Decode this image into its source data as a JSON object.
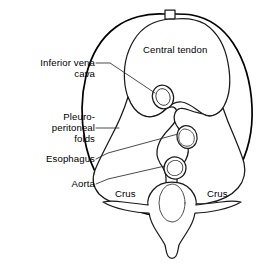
{
  "figure": {
    "line_color": "#000000",
    "background_color": "#ffffff"
  },
  "labels": {
    "inferior_vena_cava": "Inferior vena\ncava",
    "pleuroperitoneal_folds": "Pleuro-\nperitoneal\nfolds",
    "esophagus": "Esophagus",
    "aorta": "Aorta",
    "central_tendon": "Central tendon",
    "crus_left": "Crus",
    "crus_right": "Crus"
  },
  "structures": [
    {
      "name": "diaphragm-outline",
      "type": "outline"
    },
    {
      "name": "central-tendon",
      "type": "region"
    },
    {
      "name": "crus-left",
      "type": "region"
    },
    {
      "name": "crus-right",
      "type": "region"
    },
    {
      "name": "lumbar-vertebra",
      "type": "bone"
    },
    {
      "name": "sternal-notch",
      "type": "notch"
    }
  ],
  "apertures": [
    {
      "name": "caval-opening",
      "label": "Inferior vena cava",
      "cx": 163,
      "cy": 97,
      "rx": 10.5,
      "ry": 12
    },
    {
      "name": "esophageal-opening",
      "label": "Esophagus",
      "cx": 187,
      "cy": 137,
      "rx": 10,
      "ry": 11.5
    },
    {
      "name": "aortic-opening",
      "label": "Aorta",
      "cx": 175,
      "cy": 168,
      "rx": 11,
      "ry": 11
    }
  ]
}
